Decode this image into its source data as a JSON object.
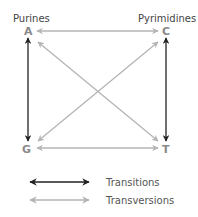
{
  "groups": {
    "left": "Purines",
    "right": "Pyrimidines"
  },
  "bases": {
    "top_left": "A",
    "top_right": "C",
    "bottom_left": "G",
    "bottom_right": "T"
  },
  "legend": {
    "transitions": "Transitions",
    "transversions": "Transversions"
  },
  "colors": {
    "transition": "#222222",
    "transversion": "#b4b4b4",
    "base_letter": "#8a8a8a"
  }
}
